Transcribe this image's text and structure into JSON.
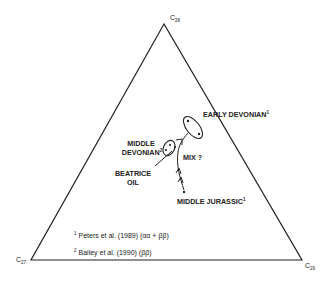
{
  "diagram": {
    "type": "ternary",
    "vertices": {
      "top": {
        "label": "C",
        "subscript": "28"
      },
      "left": {
        "label": "C",
        "subscript": "27"
      },
      "right": {
        "label": "C",
        "subscript": "29"
      }
    },
    "groups": [
      {
        "name": "EARLY DEVONIAN",
        "ref": "1"
      },
      {
        "name_line1": "MIDDLE",
        "name_line2": "DEVONIAN",
        "ref": "2"
      },
      {
        "name": "MIDDLE JURASSIC",
        "ref": "1"
      }
    ],
    "annotations": {
      "mix": "MIX ?",
      "beatrice_line1": "BEATRICE",
      "beatrice_line2": "OIL"
    },
    "references": [
      {
        "num": "1",
        "text": "Peters et  al. (1989) (αα + ββ)"
      },
      {
        "num": "2",
        "text": "Bailey et  al. (1990) (ββ)"
      }
    ]
  }
}
